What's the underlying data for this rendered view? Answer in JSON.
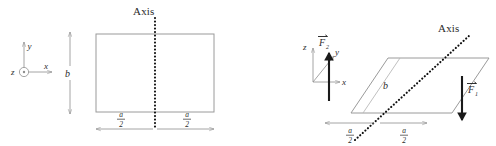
{
  "figure": {
    "background_color": "#ffffff",
    "shape_stroke_color": "#9a9a9a",
    "axis_color": "#111111",
    "force_color": "#1a1a1a",
    "label_color": "#2b2b2b"
  },
  "left_panel": {
    "name": "front-view",
    "axis_label": "Axis",
    "coordinate_frame": {
      "name": "2d-coordinate-frame",
      "z_label": "z",
      "z_glyph": "circle-dot-out-of-page",
      "y_label": "y",
      "x_label": "x"
    },
    "height_dimension": {
      "label": "b",
      "orientation": "vertical"
    },
    "width_dimensions": [
      {
        "numerator": "a",
        "denominator": "2",
        "side": "left"
      },
      {
        "numerator": "a",
        "denominator": "2",
        "side": "right"
      }
    ],
    "shape": "rectangle"
  },
  "right_panel": {
    "name": "perspective-view",
    "axis_label": "Axis",
    "coordinate_frame": {
      "name": "3d-coordinate-frame",
      "z_label": "z",
      "y_label": "y",
      "x_label": "x"
    },
    "height_dimension": {
      "label": "b",
      "orientation": "diagonal"
    },
    "width_dimensions": [
      {
        "numerator": "a",
        "denominator": "2",
        "side": "left"
      },
      {
        "numerator": "a",
        "denominator": "2",
        "side": "right"
      }
    ],
    "forces": [
      {
        "name": "force-f2",
        "symbol": "F",
        "subscript": "2",
        "vector_notation": "arrow-overbar",
        "direction": "up",
        "position": "left-edge"
      },
      {
        "name": "force-f1",
        "symbol": "F",
        "subscript": "1",
        "vector_notation": "arrow-overbar",
        "direction": "down",
        "position": "right-edge"
      }
    ],
    "shape": "parallelogram"
  }
}
